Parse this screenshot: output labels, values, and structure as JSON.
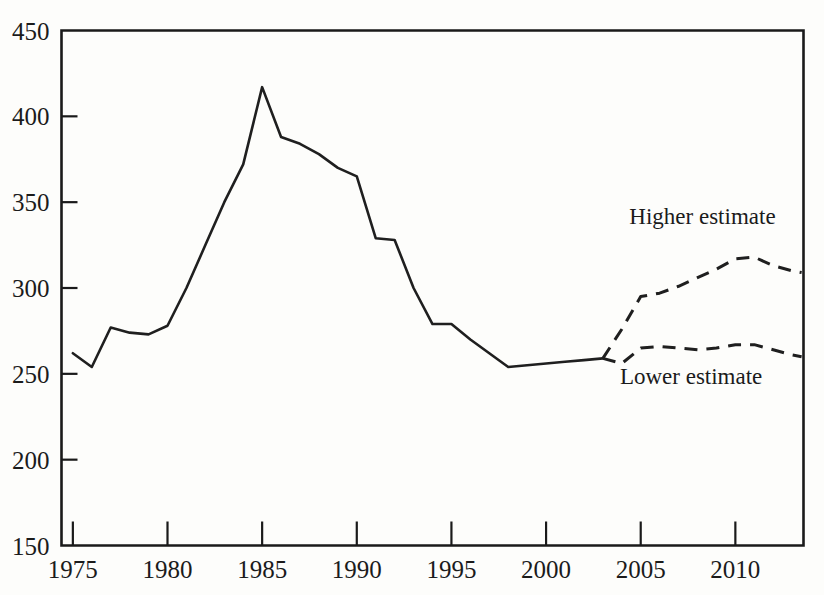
{
  "chart_data": {
    "type": "line",
    "title": "",
    "subtitle": "",
    "xlabel": "",
    "ylabel": "",
    "xlim": [
      1974.4,
      2013.6
    ],
    "ylim": [
      150,
      450
    ],
    "grid": false,
    "legend_position": "inline-annotations",
    "y_ticks": [
      150,
      200,
      250,
      300,
      350,
      400,
      450
    ],
    "y_tick_labels": [
      "150",
      "200",
      "250",
      "300",
      "350",
      "400",
      "450"
    ],
    "x_ticks": [
      1975,
      1980,
      1985,
      1990,
      1995,
      2000,
      2005,
      2010
    ],
    "x_tick_labels": [
      "1975",
      "1980",
      "1985",
      "1990",
      "1995",
      "2000",
      "2005",
      "2010"
    ],
    "series": [
      {
        "name": "Historical",
        "style": "solid",
        "x": [
          1975,
          1976,
          1977,
          1978,
          1979,
          1980,
          1981,
          1982,
          1983,
          1984,
          1985,
          1986,
          1987,
          1988,
          1989,
          1990,
          1991,
          1992,
          1993,
          1994,
          1995,
          1996,
          1997,
          1998,
          1999,
          2000,
          2001,
          2002,
          2003
        ],
        "values": [
          262,
          254,
          277,
          274,
          273,
          278,
          300,
          325,
          350,
          372,
          417,
          388,
          384,
          378,
          370,
          365,
          329,
          328,
          300,
          279,
          279,
          270,
          262,
          254,
          255,
          256,
          257,
          258,
          259
        ]
      },
      {
        "name": "Higher estimate",
        "style": "dashed",
        "x": [
          2003,
          2004,
          2005,
          2006,
          2007,
          2008,
          2009,
          2010,
          2011,
          2012,
          2013,
          2013.5
        ],
        "values": [
          259,
          276,
          295,
          297,
          301,
          306,
          311,
          317,
          318,
          313,
          310,
          309
        ]
      },
      {
        "name": "Lower estimate",
        "style": "dashed",
        "x": [
          2003,
          2004,
          2005,
          2006,
          2007,
          2008,
          2009,
          2010,
          2011,
          2012,
          2013,
          2013.5
        ],
        "values": [
          259,
          256,
          265,
          266,
          265,
          264,
          265,
          267,
          267,
          264,
          261,
          260
        ]
      }
    ],
    "annotations": [
      {
        "id": "higher-estimate-label",
        "text": "Higher estimate",
        "x": 2004.4,
        "y": 337
      },
      {
        "id": "lower-estimate-label",
        "text": "Lower estimate",
        "x": 2003.9,
        "y": 244
      }
    ],
    "colors": {
      "line": "#1f1f1f",
      "axis": "#1a1a1a",
      "background": "#fdfdfb",
      "text": "#1b1b1b"
    }
  }
}
